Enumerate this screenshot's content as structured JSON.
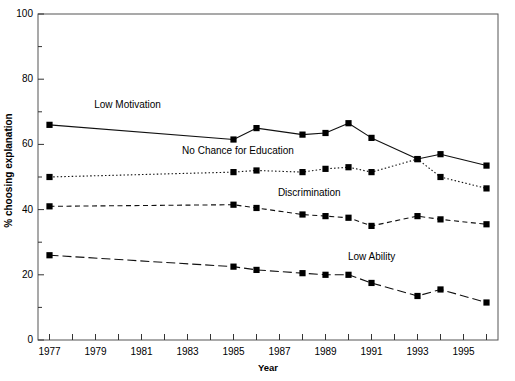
{
  "chart_data": {
    "type": "line",
    "title": "",
    "xlabel": "Year",
    "ylabel": "% choosing explanation",
    "xlim": [
      1976.5,
      1996.5
    ],
    "ylim": [
      0,
      100
    ],
    "grid": false,
    "legend_position": "inline-labels",
    "x_tick_step": 1,
    "x_labeled_step": 2,
    "y_major_step": 20,
    "y_minor_step": 10,
    "x_tick_labels": [
      "1977",
      "1979",
      "1981",
      "1983",
      "1985",
      "1987",
      "1989",
      "1991",
      "1993",
      "1995"
    ],
    "y_tick_labels": [
      "0",
      "20",
      "40",
      "60",
      "80",
      "100"
    ],
    "x": [
      1977,
      1985,
      1986,
      1988,
      1989,
      1990,
      1991,
      1993,
      1994,
      1996
    ],
    "series": [
      {
        "name": "Low Motivation",
        "style": "solid",
        "marker": "square",
        "values": [
          66,
          61.5,
          65,
          63,
          63.5,
          66.5,
          62,
          55.5,
          57,
          53.5
        ]
      },
      {
        "name": "No Chance for Education",
        "style": "dotted",
        "marker": "square",
        "values": [
          50,
          51.5,
          52,
          51.5,
          52.5,
          53,
          51.5,
          55.5,
          50,
          46.5
        ]
      },
      {
        "name": "Discrimination",
        "style": "dashed",
        "marker": "square",
        "values": [
          41,
          41.5,
          40.5,
          38.5,
          38,
          37.5,
          35,
          38,
          37,
          35.5
        ]
      },
      {
        "name": "Low Ability",
        "style": "dashdot",
        "marker": "square",
        "values": [
          26,
          22.5,
          21.5,
          20.5,
          20,
          20,
          17.5,
          13.5,
          15.5,
          11.5
        ]
      }
    ],
    "annotations": [
      {
        "text": "Low Motivation",
        "x": 1980.4,
        "y": 72
      },
      {
        "text": "No Chance for Education",
        "x": 1985.2,
        "y": 58
      },
      {
        "text": "Discrimination",
        "x": 1988.3,
        "y": 45
      },
      {
        "text": "Low Ability",
        "x": 1991.0,
        "y": 25.5
      }
    ]
  }
}
